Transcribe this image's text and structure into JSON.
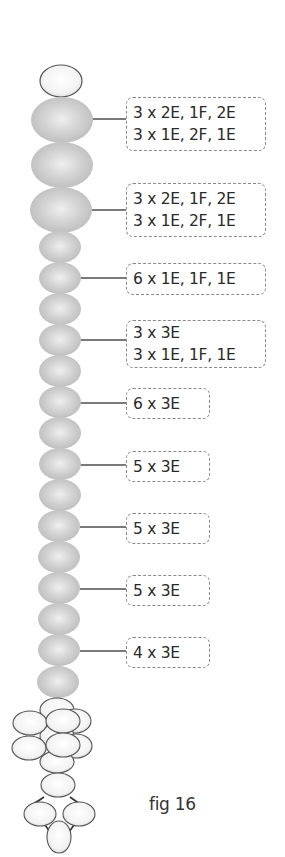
{
  "figure": {
    "caption": "fig 16",
    "colors": {
      "gray_bead": "#c6c6c6",
      "gray_bead_highlight": "#ececec",
      "white_bead": "#f4f4f4",
      "bead_outline": "#555555",
      "connector": "#7a7a7a",
      "box_border": "#8a8a8a",
      "text": "#2a2a2a"
    },
    "labels": [
      {
        "lines": [
          "3 x 2E, 1F, 2E",
          "3 x 1E, 2F, 1E"
        ],
        "box": {
          "top": 97,
          "width": 140,
          "height": 54
        }
      },
      {
        "lines": [
          "3 x 2E, 1F, 2E",
          "3 x 1E, 2F, 1E"
        ],
        "box": {
          "top": 183,
          "width": 140,
          "height": 54
        }
      },
      {
        "lines": [
          "6 x 1E, 1F, 1E"
        ],
        "box": {
          "top": 264,
          "width": 140,
          "height": 32
        }
      },
      {
        "lines": [
          "3 x 3E",
          "3 x 1E, 1F, 1E"
        ],
        "box": {
          "top": 320,
          "width": 140,
          "height": 48
        }
      },
      {
        "lines": [
          "6 x 3E"
        ],
        "box": {
          "top": 389,
          "width": 84,
          "height": 31
        }
      },
      {
        "lines": [
          "5 x 3E"
        ],
        "box": {
          "top": 451,
          "width": 84,
          "height": 31
        }
      },
      {
        "lines": [
          "5 x 3E"
        ],
        "box": {
          "top": 513,
          "width": 84,
          "height": 31
        }
      },
      {
        "lines": [
          "5 x 3E"
        ],
        "box": {
          "top": 575,
          "width": 84,
          "height": 31
        }
      },
      {
        "lines": [
          "4 x 3E"
        ],
        "box": {
          "top": 637,
          "width": 84,
          "height": 31
        }
      }
    ]
  }
}
